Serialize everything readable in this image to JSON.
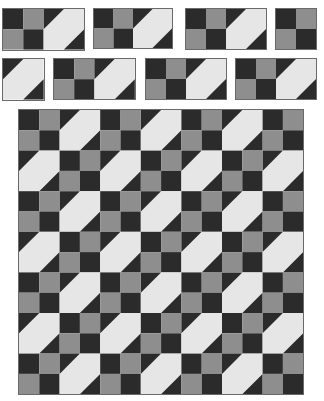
{
  "colors": {
    "dark": "#2b2b2b",
    "medium": "#8e8e8e",
    "light": "#e6e6e6",
    "border": "#6a6a6a",
    "background": "#ffffff"
  },
  "units": [
    {
      "name": "unit-top-1",
      "x": 3,
      "y": 9,
      "cell": 20.3,
      "parts": [
        "four-patch",
        "snowball"
      ]
    },
    {
      "name": "unit-top-2",
      "x": 94,
      "y": 9,
      "cell": 19.5,
      "parts": [
        "four-patch",
        "snowball"
      ]
    },
    {
      "name": "unit-top-3",
      "x": 186,
      "y": 9,
      "cell": 20.0,
      "parts": [
        "four-patch",
        "snowball"
      ]
    },
    {
      "name": "unit-top-4",
      "x": 276,
      "y": 9,
      "cell": 20.0,
      "parts": [
        "four-patch"
      ]
    },
    {
      "name": "unit-bottom-1",
      "x": 3,
      "y": 59,
      "cell": 20.3,
      "parts": [
        "snowball"
      ]
    },
    {
      "name": "unit-bottom-2",
      "x": 54,
      "y": 59,
      "cell": 20.2,
      "parts": [
        "four-patch",
        "snowball"
      ]
    },
    {
      "name": "unit-bottom-3",
      "x": 146,
      "y": 59,
      "cell": 20.0,
      "parts": [
        "four-patch",
        "snowball"
      ]
    },
    {
      "name": "unit-bottom-4",
      "x": 236,
      "y": 59,
      "cell": 20.0,
      "parts": [
        "four-patch",
        "snowball"
      ]
    }
  ],
  "quilt": {
    "x": 19,
    "y": 110,
    "cell": 20.3,
    "blocks_per_side": 7,
    "pattern": "checkerboard of four-patch and snowball blocks"
  }
}
